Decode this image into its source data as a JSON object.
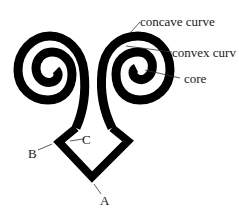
{
  "diagram": {
    "type": "labeled-figure",
    "colors": {
      "figure": "#000000",
      "background": "#ffffff",
      "text": "#1a1a1a"
    },
    "labels": {
      "concave": "concave curve",
      "convex": "convex curv",
      "core": "core",
      "a": "A",
      "b": "B",
      "c": "C"
    }
  }
}
